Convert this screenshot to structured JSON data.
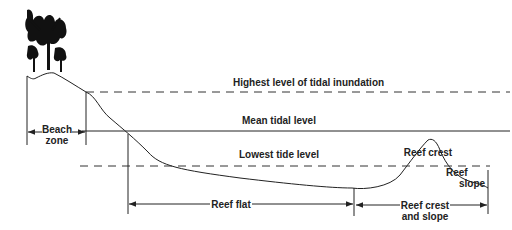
{
  "diagram": {
    "type": "reef-profile-cross-section",
    "levels": {
      "highest": "Highest level of tidal inundation",
      "mean": "Mean tidal level",
      "lowest": "Lowest tide level"
    },
    "zones": {
      "beach_line1": "Beach",
      "beach_line2": "zone",
      "reef_flat": "Reef  flat",
      "reef_crest_slope_line1": "Reef  crest",
      "reef_crest_slope_line2": "and slope"
    },
    "features": {
      "reef_crest": "Reef crest",
      "reef_slope_line1": "Reef",
      "reef_slope_line2": "slope"
    },
    "icons": [
      "palm-trees-icon",
      "arrow-left-icon",
      "arrow-right-icon"
    ],
    "colors": {
      "ink": "#222222",
      "background": "#ffffff"
    }
  }
}
